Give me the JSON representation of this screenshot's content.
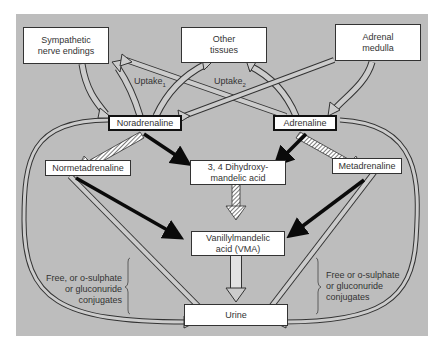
{
  "diagram": {
    "type": "metabolic-pathway",
    "nodes": {
      "sympathetic": "Sympathetic nerve endings",
      "sympathetic_line1": "Sympathetic",
      "sympathetic_line2": "nerve endings",
      "other_tissues_line1": "Other",
      "other_tissues_line2": "tissues",
      "adrenal_line1": "Adrenal",
      "adrenal_line2": "medulla",
      "noradrenaline": "Noradrenaline",
      "adrenaline": "Adrenaline",
      "normetadrenaline": "Normetadrenaline",
      "dhma_line1": "3, 4 Dihydroxy-",
      "dhma_line2": "mandelic acid",
      "metadrenaline": "Metadrenaline",
      "vma_line1": "Vanillylmandelic",
      "vma_line2": "acid (VMA)",
      "urine": "Urine"
    },
    "labels": {
      "uptake1": "Uptake",
      "uptake1_sub": "1",
      "uptake2": "Uptake",
      "uptake2_sub": "2",
      "left_conj_line1": "Free, or o-sulphate",
      "left_conj_line2": "or gluconuride",
      "left_conj_line3": "conjugates",
      "right_conj_line1": "Free or o-sulphate",
      "right_conj_line2": "or gluconuride",
      "right_conj_line3": "conjugates"
    },
    "edges": [
      {
        "from": "Sympathetic nerve endings",
        "to": "Noradrenaline",
        "style": "hollow"
      },
      {
        "from": "Noradrenaline",
        "to": "Sympathetic nerve endings",
        "style": "hollow",
        "label": "Uptake1"
      },
      {
        "from": "Adrenaline",
        "to": "Sympathetic nerve endings",
        "style": "hollow"
      },
      {
        "from": "Noradrenaline",
        "to": "Other tissues",
        "style": "hollow"
      },
      {
        "from": "Adrenaline",
        "to": "Other tissues",
        "style": "hollow",
        "label": "Uptake2"
      },
      {
        "from": "Adrenal medulla",
        "to": "Noradrenaline",
        "style": "hollow"
      },
      {
        "from": "Adrenal medulla",
        "to": "Adrenaline",
        "style": "hollow"
      },
      {
        "from": "Noradrenaline",
        "to": "Normetadrenaline",
        "style": "hatched"
      },
      {
        "from": "Adrenaline",
        "to": "Metadrenaline",
        "style": "hatched"
      },
      {
        "from": "Noradrenaline",
        "to": "3, 4 Dihydroxymandelic acid",
        "style": "solid-black"
      },
      {
        "from": "Adrenaline",
        "to": "3, 4 Dihydroxymandelic acid",
        "style": "solid-black"
      },
      {
        "from": "3, 4 Dihydroxymandelic acid",
        "to": "Vanillylmandelic acid (VMA)",
        "style": "hatched"
      },
      {
        "from": "Normetadrenaline",
        "to": "Vanillylmandelic acid (VMA)",
        "style": "solid-black"
      },
      {
        "from": "Metadrenaline",
        "to": "Vanillylmandelic acid (VMA)",
        "style": "solid-black"
      },
      {
        "from": "Vanillylmandelic acid (VMA)",
        "to": "Urine",
        "style": "hollow"
      },
      {
        "from": "Normetadrenaline",
        "to": "Urine",
        "style": "hollow"
      },
      {
        "from": "Metadrenaline",
        "to": "Urine",
        "style": "hollow"
      },
      {
        "from": "Noradrenaline",
        "to": "Urine",
        "style": "hollow-loop"
      },
      {
        "from": "Adrenaline",
        "to": "Urine",
        "style": "hollow-loop"
      }
    ],
    "colors": {
      "panel": "#bdbdbd",
      "box": "#ffffff",
      "line": "#333333",
      "solid_arrow": "#0a0a0a"
    }
  }
}
